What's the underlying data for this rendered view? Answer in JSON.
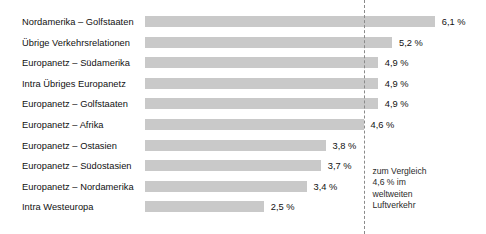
{
  "chart_data": {
    "type": "bar",
    "orientation": "horizontal",
    "title": "",
    "xlabel": "",
    "ylabel": "",
    "grid": false,
    "legend": null,
    "xlim": [
      0,
      7.0
    ],
    "value_suffix": " %",
    "decimal_separator": ",",
    "categories": [
      "Nordamerika – Golfstaaten",
      "Übrige Verkehrsrelationen",
      "Europanetz – Südamerika",
      "Intra Übriges Europanetz",
      "Europanetz – Golfstaaten",
      "Europanetz – Afrika",
      "Europanetz – Ostasien",
      "Europanetz – Südostasien",
      "Europanetz – Nordamerika",
      "Intra Westeuropa"
    ],
    "values": [
      6.1,
      5.2,
      4.9,
      4.9,
      4.9,
      4.6,
      3.8,
      3.7,
      3.4,
      2.5
    ],
    "value_labels": [
      "6,1 %",
      "5,2 %",
      "4,9 %",
      "4,9 %",
      "4,9 %",
      "4,6 %",
      "3,8 %",
      "3,7 %",
      "3,4 %",
      "2,5 %"
    ],
    "reference_line": {
      "value": 4.6,
      "style": "dashed",
      "annotation_lines": [
        "zum Vergleich",
        "4,6 % im",
        "weltweiten",
        "Luftverkehr"
      ]
    },
    "colors": {
      "bar": "#c9c9c9",
      "text": "#111111",
      "reference_line": "#8a8a8a",
      "background": "#ffffff"
    }
  }
}
